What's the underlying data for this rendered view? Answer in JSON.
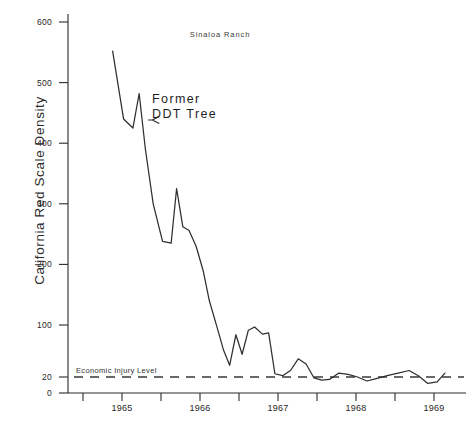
{
  "chart_data": {
    "type": "line",
    "title": "Sinaloa Ranch",
    "xlabel": "",
    "ylabel": "California Red Scale Density",
    "grid": false,
    "legend": "none",
    "xlim": [
      1964.75,
      1969.25
    ],
    "ylim": [
      0,
      600
    ],
    "y_axis_note": "broken/compressed scale between 0 and 100; ticks at 0 and 20 are compressed near the baseline",
    "xticks": [
      1965,
      1966,
      1967,
      1968,
      1969
    ],
    "xtick_labels": [
      "1965",
      "1966",
      "1967",
      "1968",
      "1969"
    ],
    "xminor_ticks": [
      1964.5,
      1965.5,
      1966.5,
      1967.5,
      1968.5,
      1969.5
    ],
    "yticks": [
      0,
      20,
      100,
      200,
      300,
      400,
      500,
      600
    ],
    "ytick_labels": [
      "0",
      "20",
      "100",
      "200",
      "300",
      "400",
      "500",
      "600"
    ],
    "annotations": [
      {
        "name": "former-ddt-tree",
        "text_line1": "Former",
        "text_line2": "DDT Tree",
        "points_to_value": 480,
        "points_to_x": 1965.35
      },
      {
        "name": "economic-injury-level",
        "text": "Economic Injury Level",
        "value": 20,
        "style": "dashed horizontal reference line"
      }
    ],
    "series": [
      {
        "name": "California Red Scale Density",
        "x": [
          1964.88,
          1965.02,
          1965.14,
          1965.22,
          1965.3,
          1965.4,
          1965.52,
          1965.63,
          1965.7,
          1965.78,
          1965.86,
          1965.95,
          1966.04,
          1966.12,
          1966.22,
          1966.3,
          1966.38,
          1966.46,
          1966.54,
          1966.62,
          1966.7,
          1966.8,
          1966.88,
          1966.96,
          1967.06,
          1967.16,
          1967.26,
          1967.36,
          1967.46,
          1967.56,
          1967.66,
          1967.78,
          1967.9,
          1968.02,
          1968.14,
          1968.26,
          1968.4,
          1968.54,
          1968.68,
          1968.8,
          1968.92,
          1969.04,
          1969.14
        ],
        "values": [
          552,
          440,
          425,
          482,
          390,
          300,
          238,
          235,
          325,
          262,
          256,
          230,
          190,
          140,
          96,
          62,
          38,
          85,
          55,
          92,
          97,
          86,
          88,
          25,
          22,
          30,
          48,
          40,
          19,
          16,
          17,
          26,
          24,
          20,
          15,
          18,
          22,
          26,
          30,
          22,
          12,
          14,
          26
        ]
      }
    ]
  },
  "axis": {
    "y_title": "California Red Scale Density",
    "eil_label": "Economic Injury Level"
  },
  "caption": {
    "text": ""
  }
}
